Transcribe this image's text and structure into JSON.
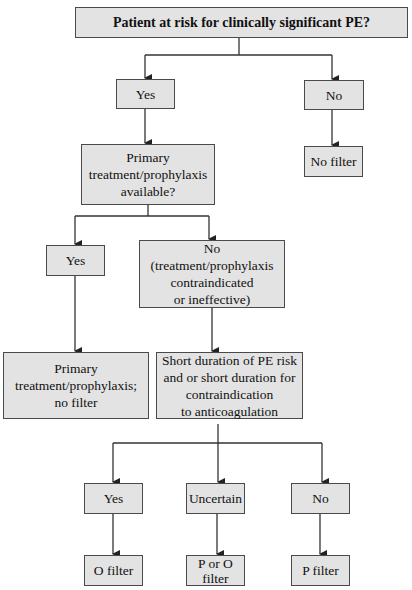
{
  "diagram": {
    "type": "flowchart",
    "nodes": {
      "root": "Patient at risk for clinically significant PE?",
      "yes1": "Yes",
      "no1": "No",
      "no_filter": "No filter",
      "primary_q": "Primary\ntreatment/prophylaxis\navailable?",
      "yes2": "Yes",
      "no2": "No\n(treatment/prophylaxis\ncontraindicated\nor ineffective)",
      "primary_result": "Primary\ntreatment/prophylaxis;\nno filter",
      "short_q": "Short duration of PE risk\nand or short duration for\ncontraindication\nto anticoagulation",
      "yes3": "Yes",
      "uncertain": "Uncertain",
      "no3": "No",
      "o_filter": "O filter",
      "p_or_o_filter": "P or O\nfilter",
      "p_filter": "P filter"
    },
    "edges": [
      [
        "root",
        "yes1"
      ],
      [
        "root",
        "no1"
      ],
      [
        "no1",
        "no_filter"
      ],
      [
        "yes1",
        "primary_q"
      ],
      [
        "primary_q",
        "yes2"
      ],
      [
        "primary_q",
        "no2"
      ],
      [
        "yes2",
        "primary_result"
      ],
      [
        "no2",
        "short_q"
      ],
      [
        "short_q",
        "yes3"
      ],
      [
        "short_q",
        "uncertain"
      ],
      [
        "short_q",
        "no3"
      ],
      [
        "yes3",
        "o_filter"
      ],
      [
        "uncertain",
        "p_or_o_filter"
      ],
      [
        "no3",
        "p_filter"
      ]
    ],
    "colors": {
      "box_fill": "#e3e3e3",
      "border": "#4a4a4a",
      "line": "#222222"
    }
  }
}
